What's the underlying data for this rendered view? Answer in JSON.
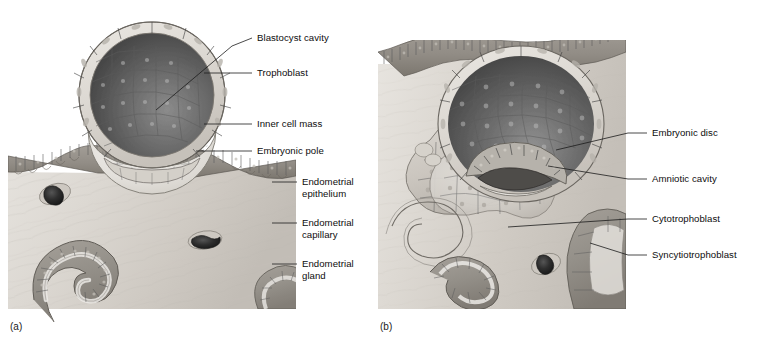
{
  "figure": {
    "background_color": "#ffffff"
  },
  "panels": [
    {
      "id": "a",
      "caption": "(a)",
      "labels": [
        {
          "id": "blastocyst-cavity",
          "text": "Blastocyst cavity",
          "text_x": 257,
          "text_y": 41,
          "leader": "M 252 38 L 232 46 L 156 110"
        },
        {
          "id": "trophoblast",
          "text": "Trophoblast",
          "text_x": 257,
          "text_y": 76,
          "leader": "M 252 73 L 204 73"
        },
        {
          "id": "inner-cell-mass",
          "text": "Inner cell mass",
          "text_x": 257,
          "text_y": 127,
          "leader": "M 252 124 L 204 124"
        },
        {
          "id": "embryonic-pole",
          "text": "Embryonic pole",
          "text_x": 257,
          "text_y": 154,
          "leader": "M 252 151 L 196 151"
        },
        {
          "id": "endometrial-epithelium",
          "text": "Endometrial",
          "text2": "epithelium",
          "text_x": 302,
          "text_y": 185,
          "leader": "M 297 182 L 272 182"
        },
        {
          "id": "endometrial-capillary",
          "text": "Endometrial",
          "text2": "capillary",
          "text_x": 302,
          "text_y": 226,
          "leader": "M 297 223 L 272 223"
        },
        {
          "id": "endometrial-gland",
          "text": "Endometrial",
          "text2": "gland",
          "text_x": 302,
          "text_y": 267,
          "leader": "M 297 264 L 272 264"
        }
      ]
    },
    {
      "id": "b",
      "caption": "(b)",
      "labels": [
        {
          "id": "embryonic-disc",
          "text": "Embryonic disc",
          "text_x": 652,
          "text_y": 136,
          "leader": "M 647 133 L 628 133"
        },
        {
          "id": "amniotic-cavity",
          "text": "Amniotic cavity",
          "text_x": 652,
          "text_y": 182,
          "leader": "M 647 179 L 628 179"
        },
        {
          "id": "cytotrophoblast",
          "text": "Cytotrophoblast",
          "text_x": 652,
          "text_y": 222,
          "leader": "M 647 219 L 628 219"
        },
        {
          "id": "syncytiotrophoblast",
          "text": "Syncytiotrophoblast",
          "text_x": 652,
          "text_y": 258,
          "leader": "M 647 255 L 628 255"
        }
      ]
    }
  ],
  "colors": {
    "tissue_light": "#dedad4",
    "tissue_mid": "#c9c4bd",
    "epithelium": "#9a968f",
    "epithelium_dark": "#7e7a74",
    "cavity_dark": "#4a4a4a",
    "cavity_mid": "#6e6e6e",
    "inner_cell_mass": "#e4e1dc",
    "trophoblast_rim": "#d8d4ce",
    "capillary": "#2b2b2b",
    "leader_line": "#1c1c1c",
    "label_text": "#0d0d0d"
  }
}
